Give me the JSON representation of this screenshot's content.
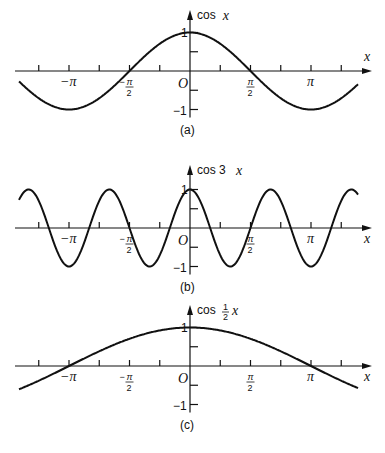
{
  "figure": {
    "panels": [
      {
        "id": "a",
        "caption": "(a)",
        "function_label": "cos",
        "function_var": "x",
        "frequency": 1,
        "coefficient_label": "",
        "axis_y": 71,
        "top_y": 10
      },
      {
        "id": "b",
        "caption": "(b)",
        "function_label": "cos 3",
        "function_var": "x",
        "frequency": 3,
        "coefficient_label": "",
        "axis_y": 228,
        "top_y": 165
      },
      {
        "id": "c",
        "caption": "(c)",
        "function_label": "cos",
        "function_var": "x",
        "frequency": 0.5,
        "coefficient_label": "1/2",
        "axis_y": 366,
        "top_y": 305
      }
    ],
    "x_axis_label": "x",
    "origin_label": "O",
    "y_tick_labels": {
      "pos": "1",
      "neg": "−1"
    },
    "x_tick_labels": [
      "−π",
      "−π/2",
      "π/2",
      "π"
    ]
  },
  "chart_data": [
    {
      "type": "line",
      "title": "cos x",
      "xlabel": "x",
      "ylabel": "cos x",
      "xlim": [
        -4.2,
        4.6
      ],
      "ylim": [
        -1,
        1
      ],
      "xticks": [
        "-π",
        "-π/2",
        "O",
        "π/2",
        "π"
      ],
      "yticks": [
        "-1",
        "1"
      ],
      "series": [
        {
          "name": "cos x",
          "function": "cos(x)"
        }
      ],
      "caption": "(a)"
    },
    {
      "type": "line",
      "title": "cos 3x",
      "xlabel": "x",
      "ylabel": "cos 3x",
      "xlim": [
        -4.2,
        4.6
      ],
      "ylim": [
        -1,
        1
      ],
      "xticks": [
        "-π",
        "-π/2",
        "O",
        "π/2",
        "π"
      ],
      "yticks": [
        "-1",
        "1"
      ],
      "series": [
        {
          "name": "cos 3x",
          "function": "cos(3x)"
        }
      ],
      "caption": "(b)"
    },
    {
      "type": "line",
      "title": "cos ½x",
      "xlabel": "x",
      "ylabel": "cos (1/2)x",
      "xlim": [
        -4.2,
        4.6
      ],
      "ylim": [
        -1,
        1
      ],
      "xticks": [
        "-π",
        "-π/2",
        "O",
        "π/2",
        "π"
      ],
      "yticks": [
        "-1",
        "1"
      ],
      "series": [
        {
          "name": "cos x/2",
          "function": "cos(x/2)"
        }
      ],
      "caption": "(c)"
    }
  ]
}
